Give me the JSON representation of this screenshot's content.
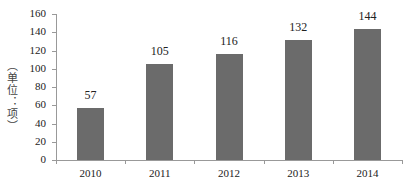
{
  "chart_data": {
    "type": "bar",
    "title": "",
    "xlabel": "",
    "ylabel": "（单位：项）",
    "categories": [
      "2010",
      "2011",
      "2012",
      "2013",
      "2014"
    ],
    "values": [
      57,
      105,
      116,
      132,
      144
    ],
    "ylim": [
      0,
      160
    ],
    "yticks": [
      0,
      20,
      40,
      60,
      80,
      100,
      120,
      140,
      160
    ],
    "grid": false,
    "legend": null,
    "bar_color": "#6b6b6b",
    "data_labels": true
  }
}
